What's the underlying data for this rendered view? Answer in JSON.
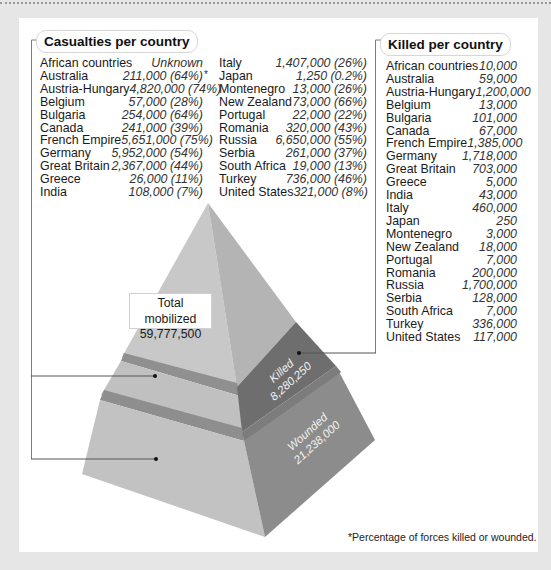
{
  "casualties_panel": {
    "title": "Casualties per country",
    "left_column": [
      {
        "country": "African countries",
        "value": "Unknown"
      },
      {
        "country": "Australia",
        "value": "211,000 (64%)",
        "footnote_mark": "*"
      },
      {
        "country": "Austria-Hungary",
        "value": "4,820,000 (74%)"
      },
      {
        "country": "Belgium",
        "value": "57,000 (28%)"
      },
      {
        "country": "Bulgaria",
        "value": "254,000 (64%)"
      },
      {
        "country": "Canada",
        "value": "241,000 (39%)"
      },
      {
        "country": "French Empire",
        "value": "5,651,000 (75%)"
      },
      {
        "country": "Germany",
        "value": "5,952,000 (54%)"
      },
      {
        "country": "Great Britain",
        "value": "2,367,000 (44%)"
      },
      {
        "country": "Greece",
        "value": "26,000 (11%)"
      },
      {
        "country": "India",
        "value": "108,000 (7%)"
      }
    ],
    "right_column": [
      {
        "country": "Italy",
        "value": "1,407,000 (26%)"
      },
      {
        "country": "Japan",
        "value": "1,250 (0.2%)"
      },
      {
        "country": "Montenegro",
        "value": "13,000 (26%)"
      },
      {
        "country": "New Zealand",
        "value": "73,000 (66%)"
      },
      {
        "country": "Portugal",
        "value": "22,000 (22%)"
      },
      {
        "country": "Romania",
        "value": "320,000 (43%)"
      },
      {
        "country": "Russia",
        "value": "6,650,000 (55%)"
      },
      {
        "country": "Serbia",
        "value": "261,000 (37%)"
      },
      {
        "country": "South Africa",
        "value": "19,000 (13%)"
      },
      {
        "country": "Turkey",
        "value": "736,000 (46%)"
      },
      {
        "country": "United States",
        "value": "321,000 (8%)"
      }
    ]
  },
  "killed_panel": {
    "title": "Killed per country",
    "rows": [
      {
        "country": "African countries",
        "value": "10,000"
      },
      {
        "country": "Australia",
        "value": "59,000"
      },
      {
        "country": "Austria-Hungary",
        "value": "1,200,000"
      },
      {
        "country": "Belgium",
        "value": "13,000"
      },
      {
        "country": "Bulgaria",
        "value": "101,000"
      },
      {
        "country": "Canada",
        "value": "67,000"
      },
      {
        "country": "French Empire",
        "value": "1,385,000"
      },
      {
        "country": "Germany",
        "value": "1,718,000"
      },
      {
        "country": "Great Britain",
        "value": "703,000"
      },
      {
        "country": "Greece",
        "value": "5,000"
      },
      {
        "country": "India",
        "value": "43,000"
      },
      {
        "country": "Italy",
        "value": "460,000"
      },
      {
        "country": "Japan",
        "value": "250"
      },
      {
        "country": "Montenegro",
        "value": "3,000"
      },
      {
        "country": "New Zealand",
        "value": "18,000"
      },
      {
        "country": "Portugal",
        "value": "7,000"
      },
      {
        "country": "Romania",
        "value": "200,000"
      },
      {
        "country": "Russia",
        "value": "1,700,000"
      },
      {
        "country": "Serbia",
        "value": "128,000"
      },
      {
        "country": "South Africa",
        "value": "7,000"
      },
      {
        "country": "Turkey",
        "value": "336,000"
      },
      {
        "country": "United States",
        "value": "117,000"
      }
    ]
  },
  "pyramid": {
    "total_label": "Total mobilized",
    "total_value": "59,777,500",
    "killed_label": "Killed",
    "killed_value": "8,280,250",
    "wounded_label": "Wounded",
    "wounded_value": "21,238,000",
    "colors": {
      "left_face": "#c4c4c4",
      "right_face_top": "#b2b2b2",
      "killed_face": "#6e6e6e",
      "wounded_face": "#8a8a8a",
      "band_shadow": "#8e8e8e"
    }
  },
  "footnote": "*Percentage of forces killed or wounded."
}
